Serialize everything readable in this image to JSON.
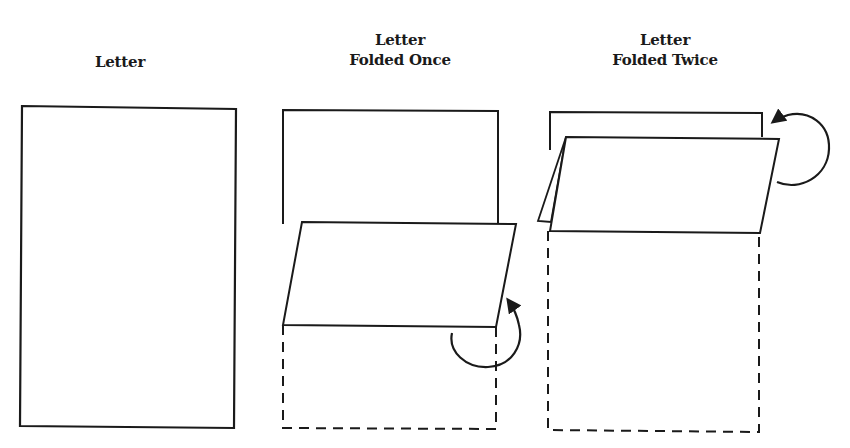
{
  "diagram": {
    "panels": [
      {
        "id": "letter",
        "title_lines": [
          "Letter"
        ]
      },
      {
        "id": "folded-once",
        "title_lines": [
          "Letter",
          "Folded Once"
        ]
      },
      {
        "id": "folded-twice",
        "title_lines": [
          "Letter",
          "Folded Twice"
        ]
      }
    ],
    "colors": {
      "stroke": "#1a1a1a",
      "background": "#ffffff"
    }
  }
}
